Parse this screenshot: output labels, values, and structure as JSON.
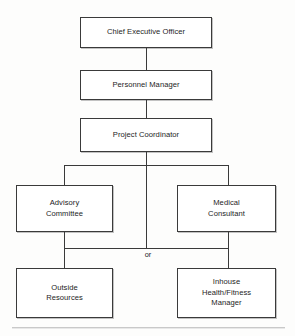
{
  "chart_title": "Organizational Chart",
  "nodes": {
    "ceo": "Chief Executive Officer",
    "personnel_manager": "Personnel Manager",
    "project_coordinator": "Project Coordinator",
    "advisory_committee": "Advisory\nCommittee",
    "medical_consultant": "Medical\nConsultant",
    "outside_resources": "Outside\nResources",
    "inhouse_manager": "Inhouse\nHealth/Fitness\nManager"
  },
  "connectors": {
    "or_label": "or"
  },
  "colors": {
    "box_border": "#3a3a3a",
    "box_fill": "#ffffff",
    "connector": "#3a3a3a",
    "text": "#1d1d1d",
    "background": "#fdfdfc",
    "footer_rule": "#c9c9c9"
  }
}
